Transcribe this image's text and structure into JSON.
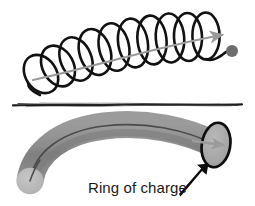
{
  "figure": {
    "background_color": "#ffffff",
    "width": 255,
    "height": 206,
    "panels": [
      {
        "id": "top-panel",
        "name": "helix-panel",
        "description": "Dark black helical coil curving from lower left to upper right with a gray axis arrow passing through it and a gray dot at the end of the coil."
      },
      {
        "id": "bottom-panel",
        "name": "ring-of-charge-panel",
        "description": "Gray curved tube (solenoid body) with a light gray circular cap at lower left and a dark outlined elliptical ring face at the upper right, with a black arrow pointing to the ring and a caption."
      }
    ]
  },
  "top_panel": {
    "helix": {
      "name": "helix-coil",
      "stroke_color": "#111111",
      "stroke_width": 2.6,
      "loop_count": 10,
      "start": {
        "x": 28,
        "y": 86
      },
      "end": {
        "x": 212,
        "y": 57
      }
    },
    "axis_arrow": {
      "name": "helix-axis-arrow",
      "color": "#9a9a9a",
      "stroke_width": 2.0,
      "start": {
        "x": 33,
        "y": 79
      },
      "end": {
        "x": 228,
        "y": 33
      },
      "direction": "right"
    },
    "end_dot": {
      "name": "particle-dot",
      "color": "#6d6d6d",
      "cx": 232,
      "cy": 51,
      "r": 6.0
    }
  },
  "divider": {
    "name": "panel-divider-line",
    "color": "#1b1b1b",
    "y": 105,
    "x_start": 12,
    "x_end": 243,
    "style": "rough-hand-drawn"
  },
  "bottom_panel": {
    "tube": {
      "name": "charged-ring-tube",
      "fill_color": "#8a8a8a",
      "center_line_color": "#4a4a4a",
      "thickness": 26
    },
    "near_cap": {
      "name": "tube-near-cap",
      "fill_color": "#b9b9b9",
      "cx": 30,
      "cy": 181,
      "r": 13
    },
    "ring_face": {
      "name": "ring-face-ellipse",
      "fill_color": "#a9a9a9",
      "stroke_color": "#0d0d0d",
      "stroke_width": 2.6,
      "cx": 216,
      "cy": 145,
      "rx": 14,
      "ry": 22
    },
    "ring_arrow": {
      "name": "ring-direction-arrow",
      "color": "#9a9a9a",
      "start": {
        "x": 196,
        "y": 142
      },
      "end": {
        "x": 226,
        "y": 145
      },
      "direction": "right"
    },
    "pointer_arrow": {
      "name": "ring-callout-arrow",
      "color": "#0d0d0d",
      "start": {
        "x": 181,
        "y": 195
      },
      "end": {
        "x": 208,
        "y": 165
      },
      "direction": "up-right"
    },
    "caption": {
      "name": "ring-of-charge-label",
      "text": "Ring of charge",
      "color": "#1a1a1a",
      "font_size_px": 15,
      "x": 88,
      "y": 179
    }
  },
  "colors": {
    "ink_black": "#111111",
    "gray_arrow": "#9a9a9a",
    "tube_gray": "#8a8a8a",
    "cap_light_gray": "#b9b9b9",
    "ring_face_gray": "#a9a9a9",
    "dot_gray": "#6d6d6d",
    "background": "#ffffff"
  }
}
